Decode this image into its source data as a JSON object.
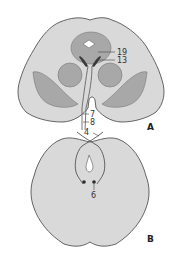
{
  "figure": {
    "panels": [
      {
        "id": "A",
        "label": "A",
        "callouts": [
          {
            "number": "19",
            "description": "pointer to dark structure near upper cavity"
          },
          {
            "number": "13",
            "description": "pointer to dark paired bands"
          },
          {
            "number": "7",
            "description": "pointer to tract near midline"
          },
          {
            "number": "8",
            "description": "pointer to tract near midline"
          }
        ]
      },
      {
        "id": "B",
        "label": "B",
        "callouts": [
          {
            "number": "4",
            "description": "pointer to crossing fibers (decussation)"
          },
          {
            "number": "6",
            "description": "pointer to paired dark nuclei"
          }
        ]
      }
    ],
    "colors": {
      "tissue_light": "#d9d9d9",
      "tissue_mid": "#a8a8a8",
      "outline": "#555555",
      "dark_structure": "#3a3a3a",
      "cavity": "#ffffff"
    }
  }
}
